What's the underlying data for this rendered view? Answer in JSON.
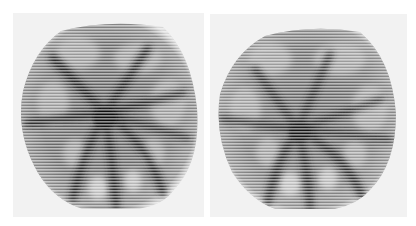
{
  "figure": {
    "background_color": "#ffffff",
    "panel_color": "#f2f2f2",
    "scan_dark_color": "#1a1a1a",
    "scan_mid_color": "#6e6e6e",
    "scan_light_color": "#bdbdbd",
    "raster_line_spacing_px": 3,
    "panels": [
      {
        "id": "left",
        "label": "Scan image 1",
        "shape": "circular",
        "texture": "horizontal raster lines"
      },
      {
        "id": "right",
        "label": "Scan image 2",
        "shape": "circular",
        "texture": "horizontal raster lines"
      }
    ],
    "footnote": ""
  }
}
